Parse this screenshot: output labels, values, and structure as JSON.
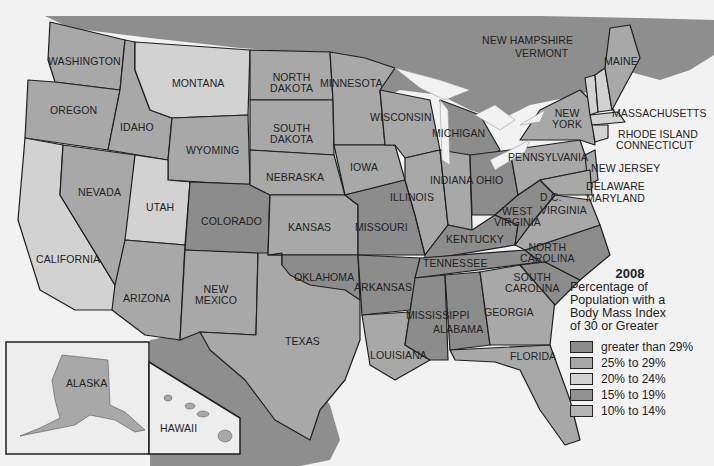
{
  "legend": {
    "year": "2008",
    "title_lines": [
      "Percentage of",
      "Population with a",
      "Body Mass Index",
      "of 30 or Greater"
    ],
    "items": [
      {
        "label": "greater than 29%",
        "color": "#8c8c8c"
      },
      {
        "label": "25% to 29%",
        "color": "#a8a8a8"
      },
      {
        "label": "20% to 24%",
        "color": "#d2d2d2"
      },
      {
        "label": "15% to 19%",
        "color": "#909090"
      },
      {
        "label": "10% to 14%",
        "color": "#b4b4b4"
      }
    ]
  },
  "states": {
    "washington": "WASHINGTON",
    "oregon": "OREGON",
    "idaho": "IDAHO",
    "montana": "MONTANA",
    "wyoming": "WYOMING",
    "california": "CALIFORNIA",
    "nevada": "NEVADA",
    "utah": "UTAH",
    "colorado": "COLORADO",
    "arizona": "ARIZONA",
    "new_mexico_1": "NEW",
    "new_mexico_2": "MEXICO",
    "texas": "TEXAS",
    "north_dakota_1": "NORTH",
    "north_dakota_2": "DAKOTA",
    "south_dakota_1": "SOUTH",
    "south_dakota_2": "DAKOTA",
    "nebraska": "NEBRASKA",
    "kansas": "KANSAS",
    "oklahoma": "OKLAHOMA",
    "minnesota": "MINNESOTA",
    "iowa": "IOWA",
    "missouri": "MISSOURI",
    "arkansas": "ARKANSAS",
    "louisiana": "LOUISIANA",
    "wisconsin": "WISCONSIN",
    "illinois": "ILLINOIS",
    "michigan": "MICHIGAN",
    "indiana": "INDIANA",
    "ohio": "OHIO",
    "kentucky": "KENTUCKY",
    "tennessee": "TENNESSEE",
    "mississippi": "MISSISSIPPI",
    "alabama": "ALABAMA",
    "georgia": "GEORGIA",
    "florida": "FLORIDA",
    "south_carolina_1": "SOUTH",
    "south_carolina_2": "CAROLINA",
    "north_carolina_1": "NORTH",
    "north_carolina_2": "CAROLINA",
    "virginia": "VIRGINIA",
    "west_virginia_1": "WEST",
    "west_virginia_2": "VIRGINIA",
    "dc": "D.C.",
    "maryland": "MARYLAND",
    "delaware": "DELAWARE",
    "new_jersey": "NEW JERSEY",
    "pennsylvania": "PENNSYLVANIA",
    "new_york_1": "NEW",
    "new_york_2": "YORK",
    "connecticut": "CONNECTICUT",
    "rhode_island": "RHODE ISLAND",
    "massachusetts": "MASSACHUSETTS",
    "vermont": "VERMONT",
    "new_hampshire": "NEW HAMPSHIRE",
    "maine": "MAINE",
    "alaska": "ALASKA",
    "hawaii": "HAWAII"
  }
}
